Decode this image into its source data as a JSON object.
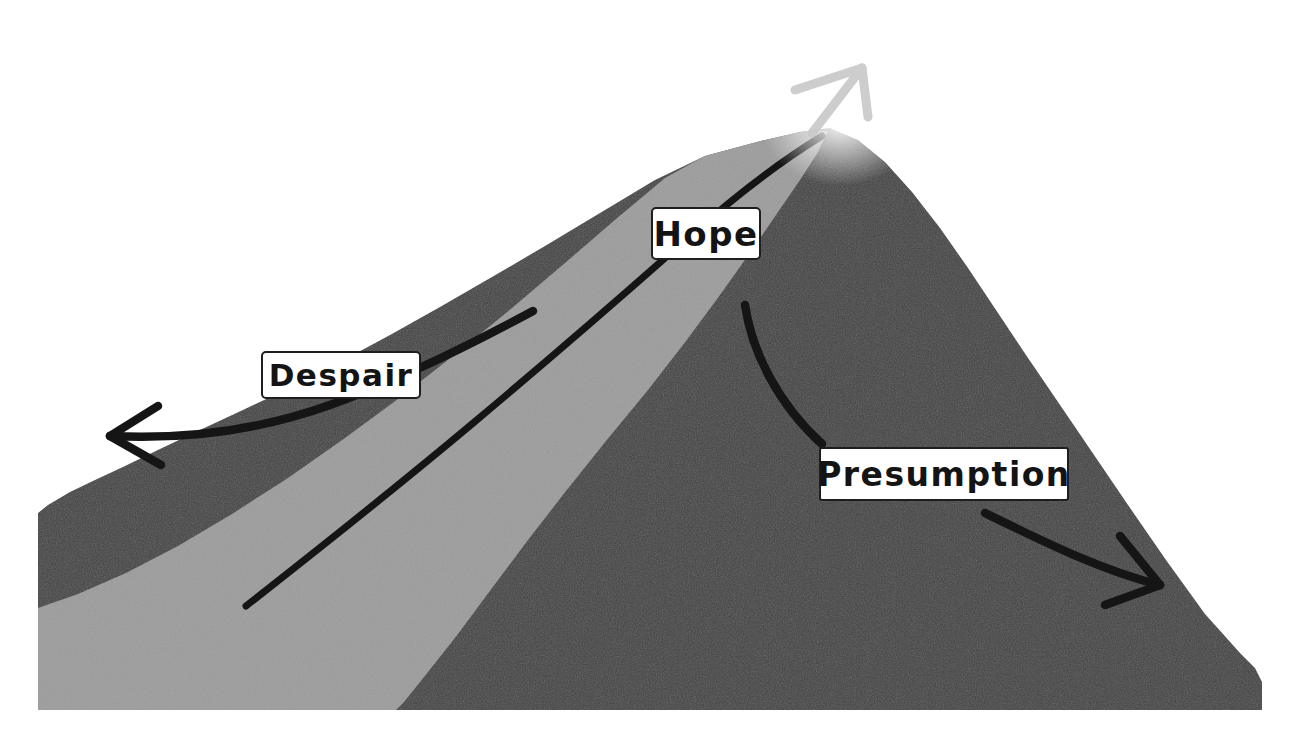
{
  "diagram": {
    "type": "concept-illustration",
    "background_color": "#ffffff",
    "canvas": {
      "width": 1304,
      "height": 754
    }
  },
  "colors": {
    "mountain_dark": "#424242",
    "mountain_light_path": "#9c9c9c",
    "ink": "#151515",
    "summit_arrow": "#c9c9c9",
    "label_background": "#ffffff",
    "label_border": "#1e1e1e",
    "label_text": "#141414"
  },
  "labels": [
    {
      "id": "hope",
      "text": "Hope",
      "position": {
        "x": 651,
        "y": 207,
        "width": 110,
        "height": 53
      },
      "meaning": "the virtuous middle path leading up the ridge to the summit"
    },
    {
      "id": "despair",
      "text": "Despair",
      "position": {
        "x": 261,
        "y": 351,
        "width": 160,
        "height": 48
      },
      "meaning": "the deficient extreme, veering down and away to the left"
    },
    {
      "id": "presumption",
      "text": "Presumption",
      "position": {
        "x": 819,
        "y": 447,
        "width": 250,
        "height": 54
      },
      "meaning": "the excessive extreme, sliding down and away to the right"
    }
  ],
  "arrows": [
    {
      "id": "summit-arrow",
      "label_ref": "hope",
      "direction": "up-right",
      "color": "#c9c9c9",
      "style": "faded-sketch",
      "description": "light grey arrow rising off the peak toward the sky"
    },
    {
      "id": "despair-arrow",
      "label_ref": "despair",
      "direction": "down-left",
      "color": "#151515",
      "style": "hand-drawn-curve",
      "description": "black curved arrow sweeping down the left slope"
    },
    {
      "id": "presumption-arrow",
      "label_ref": "presumption",
      "direction": "down-right",
      "color": "#151515",
      "style": "hand-drawn-curve",
      "description": "black curved arrow sweeping down the right slope"
    }
  ],
  "features": [
    {
      "id": "summit",
      "name": "peak",
      "position": {
        "x": 830,
        "y": 128
      }
    },
    {
      "id": "ridge-path",
      "name": "light grey trail band",
      "color": "#9c9c9c"
    },
    {
      "id": "trail-line",
      "name": "black trail centre line",
      "color": "#151515"
    }
  ]
}
